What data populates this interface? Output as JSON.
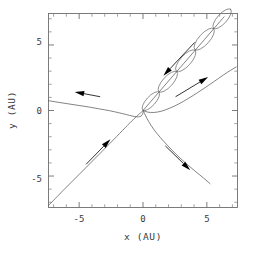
{
  "figure": {
    "background_color": "#ffffff",
    "frame_color": "#6e6e6e",
    "curve_color": "#5a5a5a",
    "arrow_color": "#000000"
  },
  "chart_data": {
    "type": "line",
    "title": "",
    "xlabel": "x (AU)",
    "ylabel": "y (AU)",
    "xlim": [
      -7.4,
      7.4
    ],
    "ylim": [
      -7.4,
      7.4
    ],
    "grid": false,
    "legend": null,
    "xticks": [
      -5,
      0,
      5
    ],
    "xticklabels": [
      "-5",
      "0",
      "5"
    ],
    "yticks": [
      -5,
      0,
      5
    ],
    "yticklabels": [
      "-5",
      "0",
      "5"
    ],
    "minor_tick_interval": 1,
    "series": [
      {
        "name": "incoming-trajectory-upper-left",
        "comment": "shallow curve entering from left edge, sweeping down to origin",
        "points": [
          [
            -7.4,
            0.75
          ],
          [
            -6.6,
            0.62
          ],
          [
            -5.8,
            0.5
          ],
          [
            -5.0,
            0.38
          ],
          [
            -4.2,
            0.26
          ],
          [
            -3.4,
            0.12
          ],
          [
            -2.6,
            -0.02
          ],
          [
            -1.9,
            -0.17
          ],
          [
            -1.3,
            -0.31
          ],
          [
            -0.85,
            -0.42
          ],
          [
            -0.5,
            -0.48
          ],
          [
            -0.25,
            -0.47
          ],
          [
            -0.08,
            -0.36
          ],
          [
            0.0,
            -0.18
          ],
          [
            0.02,
            0.0
          ]
        ]
      },
      {
        "name": "outgoing-trajectory-lower-right",
        "comment": "curve leaving origin toward lower right, ending near (5.2,-5.6)",
        "points": [
          [
            0.02,
            0.0
          ],
          [
            0.18,
            -0.35
          ],
          [
            0.45,
            -0.85
          ],
          [
            0.85,
            -1.45
          ],
          [
            1.35,
            -2.05
          ],
          [
            1.95,
            -2.7
          ],
          [
            2.6,
            -3.35
          ],
          [
            3.3,
            -3.98
          ],
          [
            4.05,
            -4.6
          ],
          [
            4.7,
            -5.12
          ],
          [
            5.25,
            -5.58
          ]
        ]
      },
      {
        "name": "incoming-trajectory-lower-left",
        "comment": "near straight line from lower-left corner up to origin",
        "points": [
          [
            -7.4,
            -7.25
          ],
          [
            -6.2,
            -6.05
          ],
          [
            -5.0,
            -4.88
          ],
          [
            -3.8,
            -3.7
          ],
          [
            -2.6,
            -2.52
          ],
          [
            -1.6,
            -1.52
          ],
          [
            -0.9,
            -0.82
          ],
          [
            -0.4,
            -0.36
          ],
          [
            -0.1,
            -0.1
          ],
          [
            0.02,
            0.0
          ]
        ]
      },
      {
        "name": "outgoing-trajectory-right",
        "comment": "curve from origin bending up to the right edge near (7.3,3.3)",
        "points": [
          [
            0.02,
            0.0
          ],
          [
            0.35,
            -0.12
          ],
          [
            0.85,
            -0.15
          ],
          [
            1.45,
            -0.05
          ],
          [
            2.1,
            0.18
          ],
          [
            2.8,
            0.5
          ],
          [
            3.55,
            0.92
          ],
          [
            4.3,
            1.38
          ],
          [
            5.1,
            1.9
          ],
          [
            5.9,
            2.44
          ],
          [
            6.65,
            2.94
          ],
          [
            7.3,
            3.32
          ]
        ]
      },
      {
        "name": "epicyclic-loop-chain-center-line",
        "comment": "mean diagonal path through the lens-shaped loops, origin to upper-right corner",
        "points": [
          [
            0.05,
            0.05
          ],
          [
            0.8,
            0.9
          ],
          [
            1.6,
            1.8
          ],
          [
            2.4,
            2.7
          ],
          [
            3.2,
            3.6
          ],
          [
            4.0,
            4.5
          ],
          [
            4.8,
            5.4
          ],
          [
            5.6,
            6.3
          ],
          [
            6.35,
            7.15
          ]
        ]
      }
    ],
    "loops": [
      {
        "name": "loop-1",
        "center": [
          0.62,
          0.72
        ],
        "semi_major": 0.95,
        "semi_minor": 0.36,
        "angle_deg": 48
      },
      {
        "name": "loop-2",
        "center": [
          1.95,
          2.2
        ],
        "semi_major": 1.05,
        "semi_minor": 0.4,
        "angle_deg": 48
      },
      {
        "name": "loop-3",
        "center": [
          3.35,
          3.8
        ],
        "semi_major": 1.1,
        "semi_minor": 0.42,
        "angle_deg": 48
      },
      {
        "name": "loop-4",
        "center": [
          4.8,
          5.45
        ],
        "semi_major": 1.1,
        "semi_minor": 0.42,
        "angle_deg": 48
      },
      {
        "name": "loop-5",
        "center": [
          6.2,
          7.0
        ],
        "semi_major": 1.0,
        "semi_minor": 0.38,
        "angle_deg": 48
      }
    ],
    "arrows": [
      {
        "name": "arrow-upper-left-outbound",
        "direction": "left",
        "tail": [
          -3.35,
          1.05
        ],
        "tip": [
          -5.35,
          1.42
        ]
      },
      {
        "name": "arrow-lower-left-inbound",
        "direction": "up-right",
        "tail": [
          -4.45,
          -4.1
        ],
        "tip": [
          -2.55,
          -2.2
        ]
      },
      {
        "name": "arrow-upper-right-outbound",
        "direction": "up-right",
        "tail": [
          2.55,
          1.05
        ],
        "tip": [
          5.1,
          2.55
        ]
      },
      {
        "name": "arrow-lower-right-outbound",
        "direction": "down-right",
        "tail": [
          1.75,
          -2.7
        ],
        "tip": [
          3.7,
          -4.55
        ]
      },
      {
        "name": "arrow-loop-chain-inbound",
        "direction": "down-left",
        "tail": [
          4.05,
          5.2
        ],
        "tip": [
          1.6,
          2.65
        ]
      }
    ]
  },
  "axes": {
    "x_axis_label": "x (AU)",
    "y_axis_label": "y (AU)",
    "x_tick_labels": [
      "-5",
      "0",
      "5"
    ],
    "y_tick_labels": [
      "5",
      "0",
      "-5"
    ]
  }
}
